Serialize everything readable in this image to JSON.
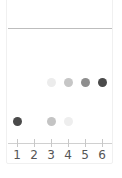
{
  "plate": {
    "lanes": [
      {
        "label": "1",
        "x": 17
      },
      {
        "label": "2",
        "x": 34
      },
      {
        "label": "3",
        "x": 51
      },
      {
        "label": "4",
        "x": 68
      },
      {
        "label": "5",
        "x": 85
      },
      {
        "label": "6",
        "x": 102
      }
    ],
    "spots": [
      {
        "lane": "3",
        "row": "upper",
        "y": 82,
        "color": "#ececec"
      },
      {
        "lane": "4",
        "row": "upper",
        "y": 82,
        "color": "#c6c6c6"
      },
      {
        "lane": "5",
        "row": "upper",
        "y": 82,
        "color": "#8e8e8e"
      },
      {
        "lane": "6",
        "row": "upper",
        "y": 82,
        "color": "#4a4a4a"
      },
      {
        "lane": "1",
        "row": "lower",
        "y": 121,
        "color": "#4a4a4a"
      },
      {
        "lane": "3",
        "row": "lower",
        "y": 121,
        "color": "#c4c4c4"
      },
      {
        "lane": "4",
        "row": "lower",
        "y": 121,
        "color": "#eeeeee"
      }
    ],
    "colors": {
      "front_line": "#bdbdbd",
      "baseline": "#d0d0d0",
      "label_text": "#555555"
    }
  }
}
